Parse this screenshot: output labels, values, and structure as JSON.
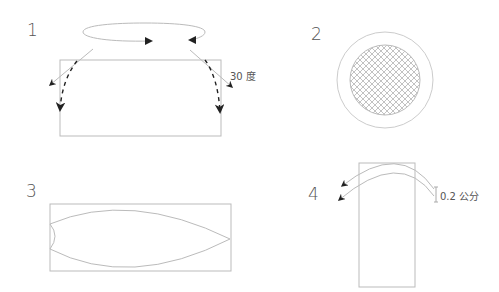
{
  "panels": [
    {
      "number": "1",
      "annotation": "30 度",
      "description": "Rectangle with rotation ellipse above; two solid arrows and two dashed curved arrows bending down at the sides"
    },
    {
      "number": "2",
      "description": "Circle with cross-hatched inner circle"
    },
    {
      "number": "3",
      "description": "Wide rectangle containing a lens/leaf shape"
    },
    {
      "number": "4",
      "annotation": "0.2 公分",
      "description": "Tall rectangle with two parallel curved arrows arching over the top"
    }
  ],
  "colors": {
    "line": "#bbbbbb",
    "arrow": "#222222",
    "text": "#555555",
    "hatch": "#999999"
  }
}
